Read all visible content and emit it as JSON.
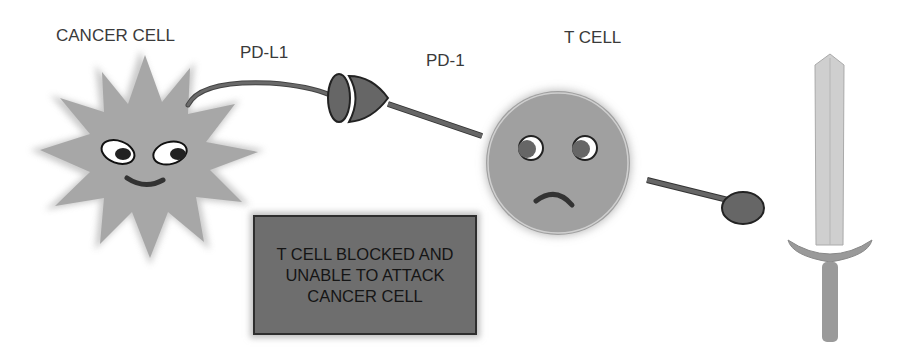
{
  "labels": {
    "cancer_cell": "CANCER CELL",
    "pd_l1": "PD-L1",
    "pd_1": "PD-1",
    "t_cell": "T CELL"
  },
  "message_box": {
    "text": "T CELL BLOCKED AND UNABLE TO ATTACK CANCER CELL"
  },
  "icons": {
    "cancer_cell": "spiky-cancer-cell-icon",
    "t_cell": "sad-t-cell-icon",
    "receptor_connector": "pd1-pdl1-connector-icon",
    "sword": "sword-icon",
    "signal_knob": "blocked-signal-knob-icon"
  },
  "colors": {
    "background": "#ffffff",
    "cell_gray": "#9a9a9a",
    "dark_gray": "#5a5a5a",
    "box_fill": "#6e6e6e",
    "text": "#3a3a3a"
  }
}
